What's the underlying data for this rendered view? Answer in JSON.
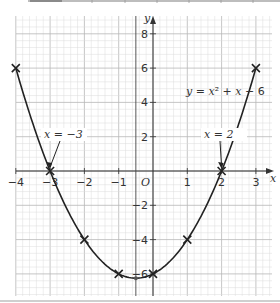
{
  "chart_data": {
    "type": "line",
    "title": "",
    "equation_label": "y = x² + x − 6",
    "xlabel": "x",
    "ylabel": "y",
    "origin_label": "O",
    "xlim": [
      -4,
      3.4
    ],
    "ylim": [
      -7.2,
      9
    ],
    "x_ticks": [
      -4,
      -3,
      -2,
      -1,
      1,
      2,
      3
    ],
    "x_tick_labels": [
      "−4",
      "−3",
      "−2",
      "−1",
      "1",
      "2",
      "3"
    ],
    "y_ticks": [
      8,
      6,
      4,
      2,
      -2,
      -4,
      -6
    ],
    "y_tick_labels": [
      "8",
      "6",
      "4",
      "2",
      "−2",
      "−4",
      "−6"
    ],
    "grid": true,
    "series": [
      {
        "name": "y = x² + x − 6",
        "x": [
          -4,
          -3,
          -2,
          -1,
          0,
          1,
          2,
          3
        ],
        "y": [
          6,
          0,
          -4,
          -6,
          -6,
          -4,
          0,
          6
        ],
        "marker": "x"
      }
    ],
    "vertex": {
      "x": -0.5,
      "y": -6.25
    },
    "line_of_symmetry": {
      "x": -0.5
    },
    "annotations": [
      {
        "text": "x = −3",
        "points_to": [
          -3,
          0
        ]
      },
      {
        "text": "x = 2",
        "points_to": [
          2,
          0
        ]
      }
    ]
  },
  "labels": {
    "equation": "y = x² + x − 6",
    "root_left": "x = −3",
    "root_right": "x = 2",
    "axis_x": "x",
    "axis_y": "y",
    "origin": "O"
  }
}
